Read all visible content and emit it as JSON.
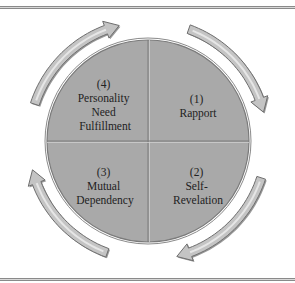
{
  "diagram": {
    "type": "cycle",
    "quadrants": [
      {
        "position": "top-right",
        "lines": [
          "(1)",
          "Rapport"
        ]
      },
      {
        "position": "bottom-right",
        "lines": [
          "(2)",
          "Self-",
          "Revelation"
        ]
      },
      {
        "position": "bottom-left",
        "lines": [
          "(3)",
          "Mutual",
          "Dependency"
        ]
      },
      {
        "position": "top-left",
        "lines": [
          "(4)",
          "Personality",
          "Need",
          "Fulfillment"
        ]
      }
    ],
    "flow_direction": "clockwise",
    "arrows": [
      {
        "from": "top",
        "to": "right"
      },
      {
        "from": "right",
        "to": "bottom"
      },
      {
        "from": "bottom",
        "to": "left"
      },
      {
        "from": "left",
        "to": "top"
      }
    ],
    "colors": {
      "circle_fill": "#a9a9a9",
      "circle_edge": "#7a7a7a",
      "arrow_fill": "#c4c4c4",
      "arrow_edge": "#6e6e6e",
      "text": "#222222"
    }
  }
}
